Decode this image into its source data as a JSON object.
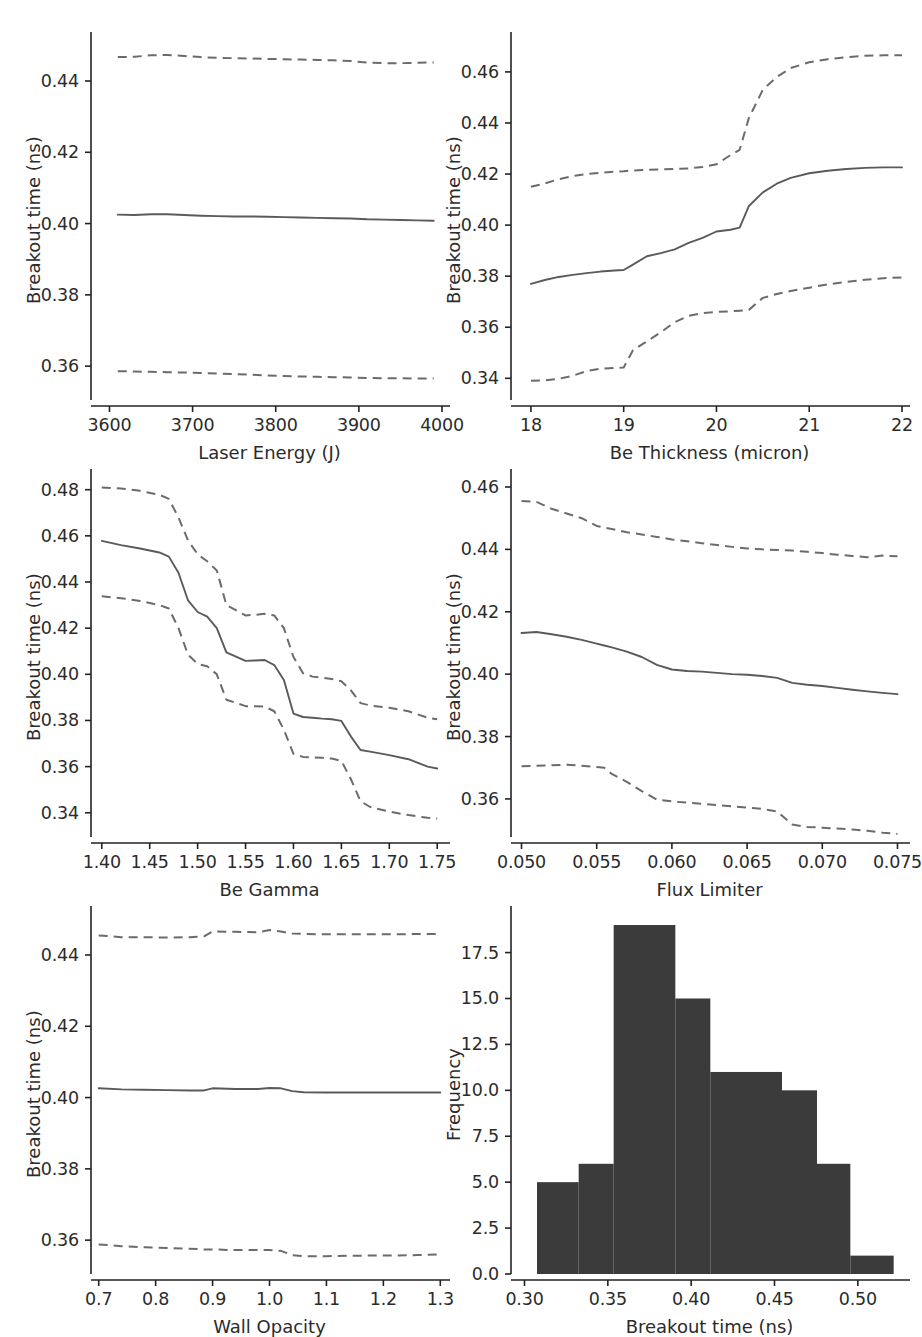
{
  "figure": {
    "width": 920,
    "height": 1311,
    "background": "#ffffff",
    "line_color_solid": "#5a5a5a",
    "line_color_dashed": "#6b6b6b",
    "hist_color": "#3b3b3b",
    "axis_color": "#222222"
  },
  "chart_data": [
    {
      "id": "laser-energy",
      "type": "line",
      "title": "",
      "xlabel": "Laser Energy (J)",
      "ylabel": "Breakout time (ns)",
      "xlim": [
        3585,
        4000
      ],
      "ylim": [
        0.3505,
        0.4515
      ],
      "xticks": [
        3600,
        3700,
        3800,
        3900,
        4000
      ],
      "xticklabels": [
        "3600",
        "3700",
        "3800",
        "3900",
        "4000"
      ],
      "yticks": [
        0.36,
        0.38,
        0.4,
        0.42,
        0.44
      ],
      "yticklabels": [
        "0.36",
        "0.38",
        "0.40",
        "0.42",
        "0.44"
      ],
      "grid": false,
      "legend": "none",
      "x": [
        3610,
        3630,
        3650,
        3670,
        3690,
        3710,
        3730,
        3750,
        3770,
        3790,
        3810,
        3830,
        3850,
        3870,
        3890,
        3910,
        3930,
        3950,
        3970,
        3990
      ],
      "series": [
        {
          "name": "upper quantile",
          "style": "dashed",
          "values": [
            0.4467,
            0.4468,
            0.4472,
            0.4473,
            0.447,
            0.4467,
            0.4465,
            0.4464,
            0.4463,
            0.4462,
            0.4461,
            0.446,
            0.4459,
            0.4458,
            0.4456,
            0.4452,
            0.445,
            0.445,
            0.4451,
            0.4452
          ]
        },
        {
          "name": "median",
          "style": "solid",
          "values": [
            0.4025,
            0.4024,
            0.4026,
            0.4026,
            0.4024,
            0.4022,
            0.4021,
            0.402,
            0.402,
            0.4019,
            0.4018,
            0.4017,
            0.4016,
            0.4015,
            0.4014,
            0.4012,
            0.4011,
            0.401,
            0.4009,
            0.4008
          ]
        },
        {
          "name": "lower quantile",
          "style": "dashed",
          "values": [
            0.3586,
            0.3585,
            0.3584,
            0.3583,
            0.3582,
            0.3581,
            0.3579,
            0.3578,
            0.3576,
            0.3574,
            0.3572,
            0.3571,
            0.357,
            0.3569,
            0.3568,
            0.3567,
            0.3566,
            0.3566,
            0.3565,
            0.3565
          ]
        }
      ]
    },
    {
      "id": "be-thickness",
      "type": "line",
      "title": "",
      "xlabel": "Be Thickness (micron)",
      "ylabel": "Breakout time (ns)",
      "xlim": [
        17.85,
        22.0
      ],
      "ylim": [
        0.3315,
        0.4725
      ],
      "xticks": [
        18,
        19,
        20,
        21,
        22
      ],
      "xticklabels": [
        "18",
        "19",
        "20",
        "21",
        "22"
      ],
      "yticks": [
        0.34,
        0.36,
        0.38,
        0.4,
        0.42,
        0.44,
        0.46
      ],
      "yticklabels": [
        "0.34",
        "0.36",
        "0.38",
        "0.40",
        "0.42",
        "0.44",
        "0.46"
      ],
      "grid": false,
      "legend": "none",
      "x": [
        18.0,
        18.15,
        18.3,
        18.45,
        18.6,
        18.75,
        18.9,
        19.0,
        19.1,
        19.25,
        19.4,
        19.55,
        19.7,
        19.85,
        20.0,
        20.15,
        20.25,
        20.35,
        20.5,
        20.65,
        20.8,
        21.0,
        21.2,
        21.4,
        21.6,
        21.8,
        22.0
      ],
      "series": [
        {
          "name": "upper quantile",
          "style": "dashed",
          "values": [
            0.415,
            0.4163,
            0.418,
            0.4192,
            0.42,
            0.4205,
            0.4209,
            0.4211,
            0.4214,
            0.4216,
            0.4218,
            0.422,
            0.4222,
            0.4228,
            0.4238,
            0.4274,
            0.4295,
            0.442,
            0.453,
            0.458,
            0.4615,
            0.4638,
            0.465,
            0.4658,
            0.4663,
            0.4665,
            0.4665
          ]
        },
        {
          "name": "median",
          "style": "solid",
          "values": [
            0.377,
            0.3785,
            0.3797,
            0.3805,
            0.3812,
            0.3818,
            0.3822,
            0.3824,
            0.3845,
            0.3878,
            0.389,
            0.3905,
            0.393,
            0.395,
            0.3975,
            0.3982,
            0.399,
            0.4075,
            0.4128,
            0.4162,
            0.4185,
            0.4203,
            0.4213,
            0.422,
            0.4224,
            0.4226,
            0.4226
          ]
        },
        {
          "name": "lower quantile",
          "style": "dashed",
          "values": [
            0.339,
            0.3392,
            0.3398,
            0.341,
            0.3428,
            0.3438,
            0.344,
            0.3442,
            0.351,
            0.3545,
            0.358,
            0.362,
            0.3645,
            0.3655,
            0.366,
            0.3662,
            0.3665,
            0.3668,
            0.3715,
            0.373,
            0.3742,
            0.3755,
            0.3768,
            0.3778,
            0.3786,
            0.3792,
            0.3795
          ]
        }
      ]
    },
    {
      "id": "be-gamma",
      "type": "line",
      "title": "",
      "xlabel": "Be Gamma",
      "ylabel": "Breakout time (ns)",
      "xlim": [
        1.395,
        1.755
      ],
      "ylim": [
        0.3295,
        0.4855
      ],
      "xticks": [
        1.4,
        1.45,
        1.5,
        1.55,
        1.6,
        1.65,
        1.7,
        1.75
      ],
      "xticklabels": [
        "1.40",
        "1.45",
        "1.50",
        "1.55",
        "1.60",
        "1.65",
        "1.70",
        "1.75"
      ],
      "yticks": [
        0.34,
        0.36,
        0.38,
        0.4,
        0.42,
        0.44,
        0.46,
        0.48
      ],
      "yticklabels": [
        "0.34",
        "0.36",
        "0.38",
        "0.40",
        "0.42",
        "0.44",
        "0.46",
        "0.48"
      ],
      "grid": false,
      "legend": "none",
      "x": [
        1.4,
        1.42,
        1.44,
        1.46,
        1.47,
        1.48,
        1.49,
        1.5,
        1.51,
        1.52,
        1.53,
        1.55,
        1.56,
        1.57,
        1.58,
        1.59,
        1.6,
        1.61,
        1.62,
        1.63,
        1.64,
        1.65,
        1.66,
        1.67,
        1.68,
        1.7,
        1.72,
        1.74,
        1.75
      ],
      "series": [
        {
          "name": "upper quantile",
          "style": "dashed",
          "values": [
            0.481,
            0.4805,
            0.4795,
            0.4778,
            0.476,
            0.468,
            0.458,
            0.452,
            0.449,
            0.445,
            0.43,
            0.4255,
            0.4258,
            0.4262,
            0.4255,
            0.42,
            0.4075,
            0.4005,
            0.399,
            0.3985,
            0.398,
            0.397,
            0.393,
            0.3875,
            0.3865,
            0.3855,
            0.384,
            0.3812,
            0.3805
          ]
        },
        {
          "name": "median",
          "style": "solid",
          "values": [
            0.4578,
            0.456,
            0.4545,
            0.4528,
            0.451,
            0.444,
            0.432,
            0.427,
            0.425,
            0.42,
            0.4095,
            0.4058,
            0.406,
            0.4062,
            0.404,
            0.3975,
            0.383,
            0.3815,
            0.3812,
            0.3808,
            0.3805,
            0.3798,
            0.373,
            0.3672,
            0.3665,
            0.365,
            0.3632,
            0.36,
            0.3592
          ]
        },
        {
          "name": "lower quantile",
          "style": "dashed",
          "values": [
            0.4338,
            0.433,
            0.4318,
            0.43,
            0.4285,
            0.42,
            0.4085,
            0.4045,
            0.4035,
            0.4,
            0.389,
            0.3862,
            0.3862,
            0.386,
            0.384,
            0.376,
            0.3655,
            0.3642,
            0.364,
            0.3638,
            0.3635,
            0.3625,
            0.3545,
            0.345,
            0.3425,
            0.3405,
            0.339,
            0.3378,
            0.3375
          ]
        }
      ]
    },
    {
      "id": "flux-limiter",
      "type": "line",
      "title": "",
      "xlabel": "Flux Limiter",
      "ylabel": "Breakout time (ns)",
      "xlim": [
        0.0497,
        0.0753
      ],
      "ylim": [
        0.3478,
        0.4632
      ],
      "xticks": [
        0.05,
        0.055,
        0.06,
        0.065,
        0.07,
        0.075
      ],
      "xticklabels": [
        "0.050",
        "0.055",
        "0.060",
        "0.065",
        "0.070",
        "0.075"
      ],
      "yticks": [
        0.36,
        0.38,
        0.4,
        0.42,
        0.44,
        0.46
      ],
      "yticklabels": [
        "0.36",
        "0.38",
        "0.40",
        "0.42",
        "0.44",
        "0.46"
      ],
      "grid": false,
      "legend": "none",
      "x": [
        0.05,
        0.051,
        0.052,
        0.053,
        0.054,
        0.055,
        0.0555,
        0.056,
        0.057,
        0.058,
        0.059,
        0.06,
        0.061,
        0.062,
        0.063,
        0.064,
        0.065,
        0.066,
        0.067,
        0.068,
        0.069,
        0.07,
        0.071,
        0.072,
        0.073,
        0.074,
        0.075
      ],
      "series": [
        {
          "name": "upper quantile",
          "style": "dashed",
          "values": [
            0.4555,
            0.4552,
            0.453,
            0.4515,
            0.45,
            0.4475,
            0.447,
            0.4465,
            0.4455,
            0.4448,
            0.444,
            0.4432,
            0.4426,
            0.442,
            0.4414,
            0.4408,
            0.4403,
            0.44,
            0.4398,
            0.4396,
            0.4392,
            0.4388,
            0.4383,
            0.4379,
            0.4375,
            0.438,
            0.4378
          ]
        },
        {
          "name": "median",
          "style": "solid",
          "values": [
            0.4132,
            0.4135,
            0.4128,
            0.412,
            0.411,
            0.4098,
            0.4092,
            0.4086,
            0.4072,
            0.4055,
            0.403,
            0.4015,
            0.401,
            0.4008,
            0.4004,
            0.4,
            0.3998,
            0.3994,
            0.3988,
            0.3972,
            0.3966,
            0.3962,
            0.3956,
            0.395,
            0.3945,
            0.394,
            0.3936
          ]
        },
        {
          "name": "lower quantile",
          "style": "dashed",
          "values": [
            0.3705,
            0.3706,
            0.3708,
            0.371,
            0.3706,
            0.3702,
            0.37,
            0.368,
            0.3655,
            0.3625,
            0.3598,
            0.3592,
            0.3588,
            0.3584,
            0.358,
            0.3576,
            0.3572,
            0.3568,
            0.356,
            0.3518,
            0.351,
            0.3508,
            0.3505,
            0.3502,
            0.3498,
            0.3492,
            0.3488
          ]
        }
      ]
    },
    {
      "id": "wall-opacity",
      "type": "line",
      "title": "",
      "xlabel": "Wall Opacity",
      "ylabel": "Breakout time (ns)",
      "xlim": [
        0.697,
        1.303
      ],
      "ylim": [
        0.3505,
        0.4515
      ],
      "xticks": [
        0.7,
        0.8,
        0.9,
        1.0,
        1.1,
        1.2,
        1.3
      ],
      "xticklabels": [
        "0.7",
        "0.8",
        "0.9",
        "1.0",
        "1.1",
        "1.2",
        "1.3"
      ],
      "yticks": [
        0.36,
        0.38,
        0.4,
        0.42,
        0.44
      ],
      "yticklabels": [
        "0.36",
        "0.38",
        "0.40",
        "0.42",
        "0.44"
      ],
      "grid": false,
      "legend": "none",
      "x": [
        0.7,
        0.74,
        0.78,
        0.82,
        0.86,
        0.885,
        0.9,
        0.94,
        0.98,
        1.0,
        1.02,
        1.04,
        1.06,
        1.1,
        1.14,
        1.18,
        1.22,
        1.26,
        1.3
      ],
      "series": [
        {
          "name": "upper quantile",
          "style": "dashed",
          "values": [
            0.4455,
            0.445,
            0.445,
            0.4449,
            0.445,
            0.4452,
            0.4466,
            0.4465,
            0.4464,
            0.447,
            0.4466,
            0.446,
            0.4459,
            0.4458,
            0.4458,
            0.4458,
            0.4458,
            0.4459,
            0.4459
          ]
        },
        {
          "name": "median",
          "style": "solid",
          "values": [
            0.4026,
            0.4023,
            0.4022,
            0.4021,
            0.402,
            0.402,
            0.4026,
            0.4024,
            0.4024,
            0.4027,
            0.4026,
            0.4018,
            0.4015,
            0.4014,
            0.4014,
            0.4014,
            0.4014,
            0.4014,
            0.4014
          ]
        },
        {
          "name": "lower quantile",
          "style": "dashed",
          "values": [
            0.3588,
            0.3583,
            0.358,
            0.3578,
            0.3576,
            0.3574,
            0.3574,
            0.3572,
            0.3572,
            0.3572,
            0.357,
            0.3558,
            0.3555,
            0.3555,
            0.3556,
            0.3557,
            0.3557,
            0.3558,
            0.356
          ]
        }
      ]
    },
    {
      "id": "breakout-histogram",
      "type": "bar",
      "title": "",
      "xlabel": "Breakout time (ns)",
      "ylabel": "Frequency",
      "xlim": [
        0.2955,
        0.5265
      ],
      "ylim": [
        0.0,
        19.6
      ],
      "xticks": [
        0.3,
        0.35,
        0.4,
        0.45,
        0.5
      ],
      "xticklabels": [
        "0.30",
        "0.35",
        "0.40",
        "0.45",
        "0.50"
      ],
      "yticks": [
        0.0,
        2.5,
        5.0,
        7.5,
        10.0,
        12.5,
        15.0,
        17.5
      ],
      "yticklabels": [
        "0.0",
        "2.5",
        "5.0",
        "7.5",
        "10.0",
        "12.5",
        "15.0",
        "17.5"
      ],
      "grid": false,
      "legend": "none",
      "bin_edges": [
        0.3075,
        0.3325,
        0.3535,
        0.3905,
        0.4115,
        0.4545,
        0.4755,
        0.4955,
        0.5215
      ],
      "bins": [
        {
          "left": 0.3075,
          "right": 0.3325,
          "value": 5
        },
        {
          "left": 0.3325,
          "right": 0.3535,
          "value": 6
        },
        {
          "left": 0.3535,
          "right": 0.3905,
          "value": 19
        },
        {
          "left": 0.3905,
          "right": 0.4115,
          "value": 15
        },
        {
          "left": 0.4115,
          "right": 0.4545,
          "value": 11
        },
        {
          "left": 0.4545,
          "right": 0.4755,
          "value": 10
        },
        {
          "left": 0.4755,
          "right": 0.4955,
          "value": 6
        },
        {
          "left": 0.4955,
          "right": 0.5215,
          "value": 1
        }
      ],
      "categories": [
        "0.3075-0.3325",
        "0.3325-0.3535",
        "0.3535-0.3905",
        "0.3905-0.4115",
        "0.4115-0.4545",
        "0.4545-0.4755",
        "0.4755-0.4955",
        "0.4955-0.5215"
      ],
      "values": [
        5,
        6,
        19,
        15,
        11,
        10,
        6,
        1
      ]
    }
  ]
}
